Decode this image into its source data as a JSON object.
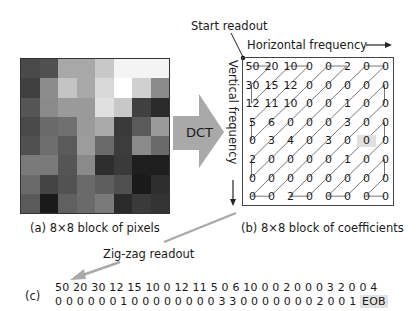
{
  "labels": {
    "start_readout": "Start readout",
    "horizontal_frequency": "Horizontal frequency",
    "vertical_frequency": "Vertical frequency",
    "dct": "DCT",
    "caption_a": "(a) 8×8 block of pixels",
    "caption_b": "(b) 8×8 block of coefficients",
    "zigzag_readout": "Zig-zag readout",
    "caption_c": "(c)"
  },
  "pixel_block": {
    "grays": [
      [
        "#4a4a4a",
        "#505050",
        "#a8a8a8",
        "#a8a8a8",
        "#c8c8c8",
        "#f4f4f4",
        "#f4f4f4",
        "#f4f4f4"
      ],
      [
        "#404040",
        "#8c8c8c",
        "#c4c4c4",
        "#a8a8a8",
        "#d8d8d8",
        "#ffffff",
        "#d0d0d0",
        "#8a8a8a"
      ],
      [
        "#555555",
        "#8a8a8a",
        "#9a9a9a",
        "#9a9a9a",
        "#e0e0e0",
        "#c8c8c8",
        "#404040",
        "#2a2a2a"
      ],
      [
        "#4a4a4a",
        "#6a6a6a",
        "#707070",
        "#9a9a9a",
        "#aaaaaa",
        "#3a3a3a",
        "#5a5a5a",
        "#9a9a9a"
      ],
      [
        "#505050",
        "#6e6e6e",
        "#5a5a5a",
        "#9c9c9c",
        "#6a6a6a",
        "#3c3c3c",
        "#8a8a8a",
        "#6a6a6a"
      ],
      [
        "#7a7a7a",
        "#7a7a7a",
        "#555555",
        "#8a8a8a",
        "#2e2e2e",
        "#3a3a3a",
        "#1e1e1e",
        "#1e1e1e"
      ],
      [
        "#6a6a6a",
        "#444444",
        "#525252",
        "#6a6a6a",
        "#5e5e5e",
        "#505050",
        "#1a1a1a",
        "#2e2e2e"
      ],
      [
        "#5a5a5a",
        "#1a1a1a",
        "#606060",
        "#6a6a6a",
        "#7a7a7a",
        "#2a2a2a",
        "#3a3a3a",
        "#333333"
      ]
    ]
  },
  "coefficients": [
    [
      50,
      20,
      10,
      0,
      0,
      2,
      0,
      0
    ],
    [
      30,
      15,
      12,
      0,
      0,
      0,
      0,
      0
    ],
    [
      12,
      11,
      10,
      0,
      0,
      1,
      0,
      0
    ],
    [
      5,
      6,
      0,
      0,
      0,
      3,
      0,
      0
    ],
    [
      0,
      3,
      4,
      0,
      3,
      0,
      0,
      0
    ],
    [
      2,
      0,
      0,
      0,
      0,
      1,
      0,
      0
    ],
    [
      0,
      0,
      0,
      0,
      0,
      0,
      0,
      0
    ],
    [
      0,
      0,
      2,
      0,
      0,
      0,
      0,
      0
    ]
  ],
  "highlight_cell": {
    "row": 4,
    "col": 6,
    "color": "#e0e0e0"
  },
  "sequence": {
    "line1": "50 20 30 12 15 10 0 12 11 5 0 6 10  0 0 2 0 0 0 3 2 0 0 4",
    "line2": "0 0 0 0 0 0 1 0 0 0 0 0 0 0 0 3 3 0 0 0 0 0 0 0 2 0 0 1",
    "eob": "EOB"
  },
  "colors": {
    "arrow_gray": "#a9a9a9",
    "zigzag_line": "#555555",
    "text": "#1a1a1a"
  }
}
